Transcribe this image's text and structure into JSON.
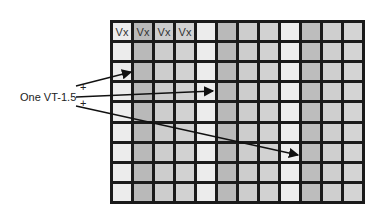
{
  "diagram": {
    "rows": 9,
    "columns": 12,
    "column_shades": [
      "#ececec",
      "#b9b9b9",
      "#cdcdcd",
      "#d2d2d2",
      "#ececec",
      "#b9b9b9",
      "#cdcdcd",
      "#d2d2d2",
      "#eeeeee",
      "#bdbdbd",
      "#cfcfcf",
      "#d4d4d4"
    ],
    "header_cells": [
      "Vx",
      "Vx",
      "Vx",
      "Vx"
    ],
    "label": "One VT-1.5",
    "plus_signs": [
      "+",
      "+"
    ],
    "arrows": [
      {
        "from": [
          76,
          86
        ],
        "to": [
          131,
          72
        ]
      },
      {
        "from": [
          76,
          97
        ],
        "to": [
          213,
          91
        ]
      },
      {
        "from": [
          76,
          106
        ],
        "to": [
          298,
          155
        ]
      }
    ]
  }
}
